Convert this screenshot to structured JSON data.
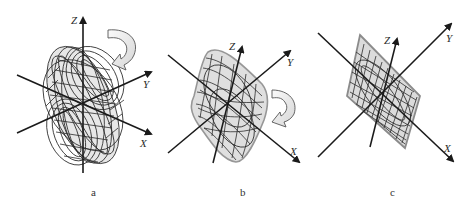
{
  "figure": {
    "panels": [
      {
        "id": "a",
        "caption": "a",
        "axes": {
          "x_label": "X",
          "y_label": "Y",
          "z_label": "Z"
        },
        "shape": "twisted ellipsoidal wire mesh",
        "rotation_arrow": "curved arrow, clockwise then down-left"
      },
      {
        "id": "b",
        "caption": "b",
        "axes": {
          "x_label": "X",
          "y_label": "Y",
          "z_label": "Z"
        },
        "shape": "rounded rhombic wire mesh",
        "rotation_arrow": "curved arrow, clockwise then down-left"
      },
      {
        "id": "c",
        "caption": "c",
        "axes": {
          "x_label": "X",
          "y_label": "Y",
          "z_label": "Z"
        },
        "shape": "flat parallelogram wire mesh",
        "rotation_arrow": null
      }
    ],
    "colors": {
      "ink": "#1a1a1a",
      "mesh_fill": "#b9b9b9",
      "arrow_fill": "#e8e8e8",
      "background": "#ffffff"
    }
  }
}
